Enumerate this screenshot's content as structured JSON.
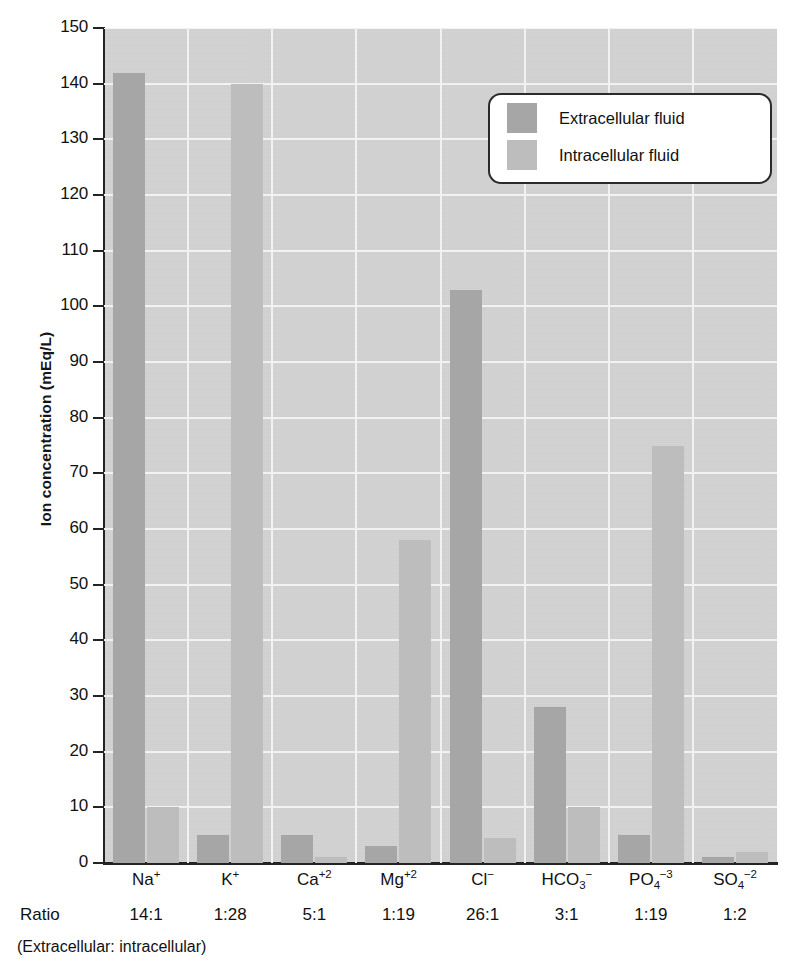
{
  "chart_data": {
    "type": "bar",
    "title": "",
    "xlabel": "",
    "ylabel": "Ion concentration (mEq/L)",
    "ylim": [
      0,
      150
    ],
    "ytick_step": 10,
    "yticks": [
      0,
      10,
      20,
      30,
      40,
      50,
      60,
      70,
      80,
      90,
      100,
      110,
      120,
      130,
      140,
      150
    ],
    "grid": true,
    "legend_position": "top-right",
    "categories": [
      "Na⁺",
      "K⁺",
      "Ca⁺²",
      "Mg⁺²",
      "Cl⁻",
      "HCO₃⁻",
      "PO₄⁻³",
      "SO₄⁻²"
    ],
    "category_parts": [
      {
        "base": "Na",
        "sup": "+"
      },
      {
        "base": "K",
        "sup": "+"
      },
      {
        "base": "Ca",
        "sup": "+2"
      },
      {
        "base": "Mg",
        "sup": "+2"
      },
      {
        "base": "Cl",
        "sup": "−"
      },
      {
        "base": "HCO",
        "sub": "3",
        "sup": "−"
      },
      {
        "base": "PO",
        "sub": "4",
        "sup": "−3"
      },
      {
        "base": "SO",
        "sub": "4",
        "sup": "−2"
      }
    ],
    "series": [
      {
        "name": "Extracellular fluid",
        "color": "#a6a6a6",
        "values": [
          142,
          5,
          5,
          3,
          103,
          28,
          5,
          1
        ]
      },
      {
        "name": "Intracellular fluid",
        "color": "#bdbdbd",
        "values": [
          10,
          140,
          1,
          58,
          4.5,
          10,
          75,
          2
        ]
      }
    ],
    "ratios": [
      "14:1",
      "1:28",
      "5:1",
      "1:19",
      "26:1",
      "3:1",
      "1:19",
      "1:2"
    ],
    "ratio_label": "Ratio",
    "ratio_note": "(Extracellular: intracellular)",
    "colors": {
      "extracellular": "#a6a6a6",
      "intracellular": "#bdbdbd",
      "plot_background": "#d3d3d3",
      "gridline": "#f2f2f2",
      "axis": "#232323",
      "text": "#111111"
    }
  },
  "legend": {
    "items": [
      {
        "label": "Extracellular fluid"
      },
      {
        "label": "Intracellular fluid"
      }
    ]
  }
}
